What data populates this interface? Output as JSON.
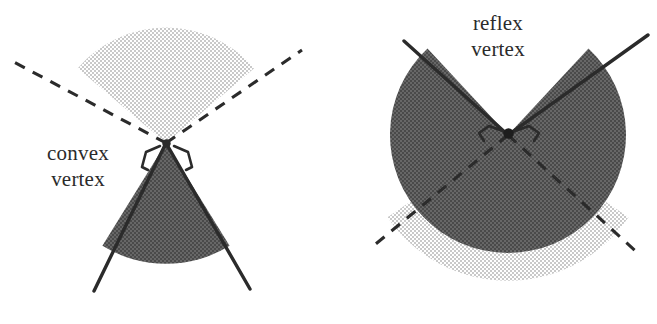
{
  "figure": {
    "background_color": "#ffffff",
    "width": 657,
    "height": 324
  },
  "colors": {
    "light_wedge_fill": "#dcdcdc",
    "dark_wedge_fill": "#565656",
    "stroke": "#2b2b2b",
    "text": "#2b2b2b",
    "background": "#ffffff"
  },
  "panels": [
    {
      "id": "convex",
      "label_line1": "convex",
      "label_line2": "vertex",
      "label_x": 78,
      "label_y1": 160,
      "label_y2": 186,
      "vertex_x": 166,
      "vertex_y": 143,
      "interior_radius": 120,
      "exterior_radius": 112,
      "interior_start_deg": 58,
      "interior_end_deg": 122,
      "exterior_start_deg": 218,
      "exterior_end_deg": 322,
      "ray_length": 160,
      "dash_length": 165,
      "interior_shade": "dark",
      "exterior_shade": "light",
      "solid_ray_angles_deg": [
        58,
        122
      ],
      "dashed_ray_angles_deg": [
        218,
        322
      ]
    },
    {
      "id": "reflex",
      "label_line1": "reflex",
      "label_line2": "vertex",
      "label_x": 498,
      "label_y1": 30,
      "label_y2": 56,
      "vertex_x": 508,
      "vertex_y": 135,
      "interior_radius": 118,
      "exterior_radius": 118,
      "interior_start_deg": 227,
      "interior_end_deg": 493,
      "exterior_start_deg": 133,
      "exterior_end_deg": 227,
      "ray_length": 150,
      "dash_length": 172,
      "interior_shade": "dark",
      "exterior_shade": "light",
      "solid_ray_angles_deg": [
        227,
        313
      ],
      "dashed_ray_angles_deg": [
        47,
        133
      ]
    }
  ],
  "annotations": {
    "right_angle_marker_name": "vertex-angle-marker",
    "marker_count_per_vertex": 2
  }
}
